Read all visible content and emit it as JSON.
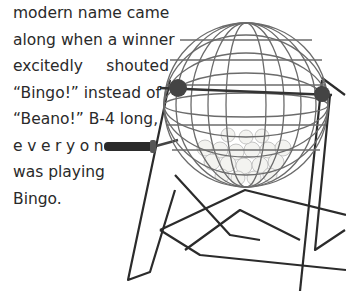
{
  "article": {
    "lines": [
      "modern name came",
      "along when a winner",
      "excitedly shouted",
      "“Bingo!” instead of",
      "“Beano!” B-4 long,",
      "everyone",
      "was playing",
      "Bingo."
    ]
  },
  "illustration": {
    "subject": "bingo-cage",
    "description": "Wire bingo ball cage with crank handle on stand, filled with balls"
  }
}
